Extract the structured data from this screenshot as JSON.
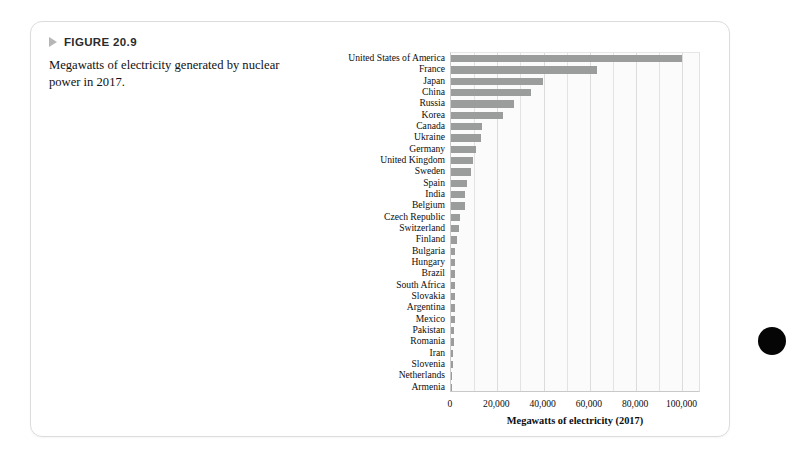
{
  "figure": {
    "label": "FIGURE 20.9",
    "caption": "Megawatts of electricity generated by nuclear power in 2017.",
    "triangle_icon": "triangle-right-icon",
    "accent_color": "#b6b6b6"
  },
  "page": {
    "background_color": "#ffffff",
    "card_border_color": "#dcdcdc",
    "thumb_color": "#050505"
  },
  "chart_data": {
    "type": "bar",
    "orientation": "horizontal",
    "title": "",
    "xlabel": "Megawatts of electricity (2017)",
    "ylabel": "",
    "xlim": [
      0,
      108000
    ],
    "xticks": [
      0,
      20000,
      40000,
      60000,
      80000,
      100000
    ],
    "xtick_labels": [
      "0",
      "20,000",
      "40,000",
      "60,000",
      "80,000",
      "100,000"
    ],
    "minor_gridlines": [
      10000,
      30000,
      50000,
      70000,
      90000
    ],
    "grid": true,
    "legend": "none",
    "bar_color": "#9b9c9c",
    "plot_background": "#fbfbfb",
    "categories": [
      "United States of America",
      "France",
      "Japan",
      "China",
      "Russia",
      "Korea",
      "Canada",
      "Ukraine",
      "Germany",
      "United Kingdom",
      "Sweden",
      "Spain",
      "India",
      "Belgium",
      "Czech Republic",
      "Switzerland",
      "Finland",
      "Bulgaria",
      "Hungary",
      "Brazil",
      "South Africa",
      "Slovakia",
      "Argentina",
      "Mexico",
      "Pakistan",
      "Romania",
      "Iran",
      "Slovenia",
      "Netherlands",
      "Armenia"
    ],
    "values": [
      99600,
      63100,
      39800,
      34500,
      27000,
      22500,
      13600,
      13100,
      10800,
      9400,
      8600,
      7100,
      6200,
      5900,
      3900,
      3300,
      2800,
      1900,
      1900,
      1900,
      1860,
      1810,
      1630,
      1550,
      1320,
      1300,
      915,
      688,
      482,
      375
    ]
  }
}
